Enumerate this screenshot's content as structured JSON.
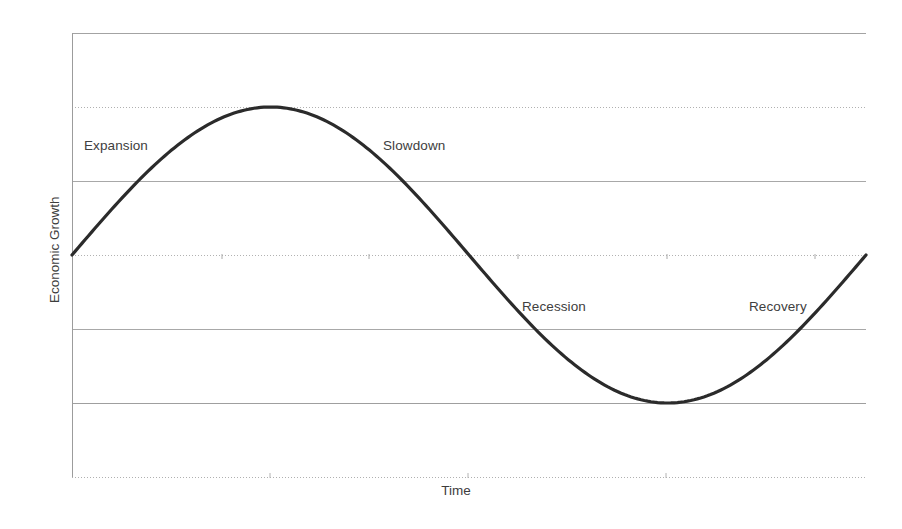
{
  "chart_data": {
    "type": "line",
    "title": "",
    "subtitle": "",
    "xlabel": "Time",
    "ylabel": "Economic Growth",
    "grid": true,
    "legend_position": "none",
    "xlim": [
      0,
      4
    ],
    "ylim": [
      -1.5,
      1.5
    ],
    "x_tick_labels": [],
    "y_tick_labels": [],
    "gridlines_y": [
      1.5,
      1.0,
      0.5,
      0.0,
      -0.5,
      -1.0,
      -1.5
    ],
    "gridline_styles": [
      "solid",
      "dotted",
      "solid",
      "dotted",
      "solid",
      "solid",
      "dotted"
    ],
    "series": [
      {
        "name": "Business Cycle",
        "color": "#2b2b2b",
        "x": [
          0.0,
          0.25,
          0.5,
          0.75,
          1.0,
          1.25,
          1.5,
          1.75,
          2.0,
          2.25,
          2.5,
          2.75,
          3.0,
          3.25,
          3.5,
          3.75,
          4.0
        ],
        "y": [
          0.0,
          0.38,
          0.71,
          0.92,
          1.0,
          0.92,
          0.71,
          0.38,
          0.0,
          -0.38,
          -0.71,
          -0.92,
          -1.0,
          -0.92,
          -0.71,
          -0.38,
          0.0
        ]
      }
    ],
    "annotations": [
      {
        "text": "Expansion",
        "x": 0.06,
        "y": 0.8
      },
      {
        "text": "Slowdown",
        "x": 1.57,
        "y": 0.8
      },
      {
        "text": "Recession",
        "x": 2.27,
        "y": -0.29
      },
      {
        "text": "Recovery",
        "x": 3.41,
        "y": -0.29
      }
    ],
    "key_points": {
      "start": {
        "x": 0.0,
        "y": 0.0
      },
      "peak": {
        "x": 1.0,
        "y": 1.0
      },
      "midpoint_crossing": {
        "x": 2.0,
        "y": 0.0
      },
      "trough": {
        "x": 3.0,
        "y": -1.0
      },
      "end": {
        "x": 4.0,
        "y": 0.0
      }
    }
  },
  "axes": {
    "y_label": "Economic Growth",
    "x_label": "Time"
  },
  "annotations": {
    "expansion": "Expansion",
    "slowdown": "Slowdown",
    "recession": "Recession",
    "recovery": "Recovery"
  },
  "colors": {
    "curve": "#2b2b2b",
    "grid_solid": "#a9a9a9",
    "grid_dotted": "#b4b4b4",
    "axis": "#9a9a9a",
    "text": "#3d3d3d",
    "background": "#ffffff"
  }
}
